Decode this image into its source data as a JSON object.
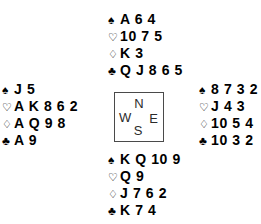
{
  "diagram": {
    "type": "bridge-deal",
    "background_color": "#ffffff",
    "text_color": "#000000",
    "box_border_color": "#4a4a4a"
  },
  "suits": {
    "spade": {
      "symbol": "♠",
      "name": "spade-symbol",
      "filled": true
    },
    "heart": {
      "symbol": "♡",
      "name": "heart-symbol",
      "filled": false
    },
    "diamond": {
      "symbol": "♢",
      "name": "diamond-symbol",
      "filled": false
    },
    "club": {
      "symbol": "♣",
      "name": "club-symbol",
      "filled": true
    }
  },
  "compass": {
    "north": "N",
    "west": "W",
    "east": "E",
    "south": "S"
  },
  "hands": {
    "north": {
      "position": "North",
      "spades": "A 6 4",
      "hearts": "10 7 5",
      "diamonds": "K 3",
      "clubs": "Q J 8 6 5"
    },
    "west": {
      "position": "West",
      "spades": "J 5",
      "hearts": "A K 8 6 2",
      "diamonds": "A Q 9 8",
      "clubs": "A 9"
    },
    "east": {
      "position": "East",
      "spades": "8 7 3 2",
      "hearts": "J 4 3",
      "diamonds": "10 5 4",
      "clubs": "10 3 2"
    },
    "south": {
      "position": "South",
      "spades": "K Q 10 9",
      "hearts": "Q 9",
      "diamonds": "J 7 6 2",
      "clubs": "K 7 4"
    }
  }
}
